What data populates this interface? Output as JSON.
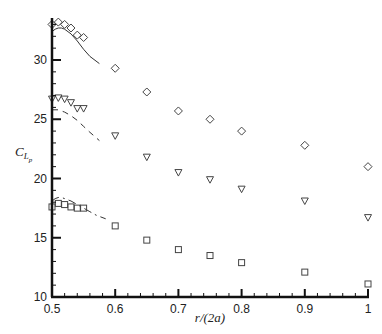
{
  "chart_data": {
    "type": "scatter",
    "title": "",
    "xlabel": "r/(2a)",
    "ylabel": "C_{L_p}",
    "xlim": [
      0.5,
      1.0
    ],
    "ylim": [
      10,
      33.4
    ],
    "grid": false,
    "legend": null,
    "x_ticks": [
      0.5,
      0.6,
      0.7,
      0.8,
      0.9,
      1.0
    ],
    "x_tick_labels": [
      "0.5",
      "0.6",
      "0.7",
      "0.8",
      "0.9",
      "1"
    ],
    "y_ticks": [
      10,
      15,
      20,
      25,
      30
    ],
    "y_tick_labels": [
      "10",
      "15",
      "20",
      "25",
      "30"
    ],
    "series": [
      {
        "name": "diamond-markers",
        "marker": "diamond",
        "x": [
          0.5,
          0.51,
          0.52,
          0.53,
          0.54,
          0.55,
          0.6,
          0.65,
          0.7,
          0.75,
          0.8,
          0.9,
          1.0
        ],
        "y": [
          33.0,
          33.2,
          33.0,
          32.7,
          32.1,
          31.9,
          29.3,
          27.3,
          25.7,
          25.0,
          24.0,
          22.8,
          21.0
        ]
      },
      {
        "name": "triangle-markers",
        "marker": "triangle-down",
        "x": [
          0.5,
          0.51,
          0.52,
          0.53,
          0.54,
          0.55,
          0.6,
          0.65,
          0.7,
          0.75,
          0.8,
          0.9,
          1.0
        ],
        "y": [
          26.7,
          26.8,
          26.7,
          26.4,
          25.9,
          25.9,
          23.6,
          21.8,
          20.5,
          19.9,
          19.1,
          18.1,
          16.7
        ]
      },
      {
        "name": "square-markers",
        "marker": "square",
        "x": [
          0.5,
          0.51,
          0.52,
          0.53,
          0.54,
          0.55,
          0.6,
          0.65,
          0.7,
          0.75,
          0.8,
          0.9,
          1.0
        ],
        "y": [
          17.6,
          17.9,
          17.8,
          17.6,
          17.5,
          17.5,
          16.0,
          14.8,
          14.0,
          13.5,
          12.9,
          12.1,
          11.1
        ]
      },
      {
        "name": "solid-curve",
        "line": "solid",
        "x": [
          0.5,
          0.505,
          0.51,
          0.515,
          0.52,
          0.53,
          0.54,
          0.55,
          0.56,
          0.575
        ],
        "y": [
          32.4,
          32.6,
          32.7,
          32.7,
          32.6,
          32.2,
          31.6,
          30.9,
          30.3,
          29.7
        ]
      },
      {
        "name": "dashed-curve",
        "line": "dashed",
        "x": [
          0.5,
          0.51,
          0.52,
          0.53,
          0.54,
          0.55,
          0.56,
          0.575
        ],
        "y": [
          25.8,
          25.8,
          25.6,
          25.3,
          24.9,
          24.4,
          23.9,
          23.2
        ]
      },
      {
        "name": "dashdot-curve",
        "line": "dashdot",
        "x": [
          0.5,
          0.505,
          0.51,
          0.515,
          0.52,
          0.53,
          0.54,
          0.55,
          0.56,
          0.57,
          0.585
        ],
        "y": [
          18.1,
          18.3,
          18.4,
          18.4,
          18.3,
          18.1,
          17.8,
          17.5,
          17.2,
          16.9,
          16.6
        ]
      }
    ]
  }
}
